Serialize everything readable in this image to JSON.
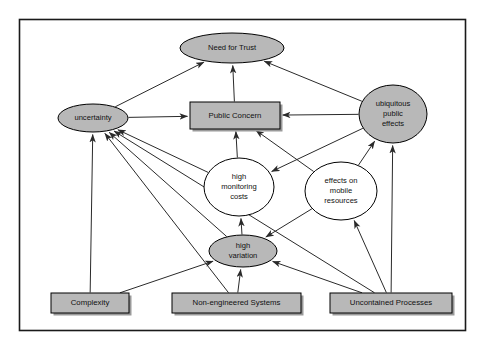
{
  "diagram": {
    "frame": {
      "x": 19,
      "y": 19,
      "width": 446,
      "height": 311
    },
    "nodes": [
      {
        "id": "need-for-trust",
        "label": "Need for Trust",
        "shape": "ellipse",
        "fill": "#b8b8b8",
        "cx": 232,
        "cy": 48,
        "rx": 52,
        "ry": 15,
        "lines": [
          "Need for Trust"
        ]
      },
      {
        "id": "uncertainty",
        "label": "uncertainty",
        "shape": "ellipse",
        "fill": "#b8b8b8",
        "cx": 93,
        "cy": 118,
        "rx": 35,
        "ry": 14,
        "lines": [
          "uncertainty"
        ]
      },
      {
        "id": "public-concern",
        "label": "Public Concern",
        "shape": "rect",
        "fill": "#b8b8b8",
        "x": 190,
        "y": 102,
        "width": 90,
        "height": 27,
        "lines": [
          "Public Concern"
        ]
      },
      {
        "id": "ubiquitous-public-effects",
        "label": "ubiquitous public effects",
        "shape": "ellipse",
        "fill": "#b8b8b8",
        "cx": 393,
        "cy": 114,
        "rx": 34,
        "ry": 29,
        "lines": [
          "ubiquitous",
          "public",
          "effects"
        ]
      },
      {
        "id": "high-monitoring-costs",
        "label": "high monitoring costs",
        "shape": "ellipse",
        "fill": "#ffffff",
        "cx": 239,
        "cy": 187,
        "rx": 35,
        "ry": 29,
        "lines": [
          "high",
          "monitoring",
          "costs"
        ]
      },
      {
        "id": "effects-on-mobile-resources",
        "label": "effects on mobile resources",
        "shape": "ellipse",
        "fill": "#ffffff",
        "cx": 341,
        "cy": 191,
        "rx": 36,
        "ry": 29,
        "lines": [
          "effects on",
          "mobile",
          "resources"
        ]
      },
      {
        "id": "high-variation",
        "label": "high variation",
        "shape": "ellipse",
        "fill": "#b8b8b8",
        "cx": 243,
        "cy": 251,
        "rx": 34,
        "ry": 16,
        "lines": [
          "high",
          "variation"
        ]
      },
      {
        "id": "complexity",
        "label": "Complexity",
        "shape": "rect",
        "fill": "#b8b8b8",
        "x": 51,
        "y": 293,
        "width": 78,
        "height": 20,
        "lines": [
          "Complexity"
        ]
      },
      {
        "id": "non-engineered-systems",
        "label": "Non-engineered Systems",
        "shape": "rect",
        "fill": "#b8b8b8",
        "x": 172,
        "y": 293,
        "width": 129,
        "height": 20,
        "lines": [
          "Non-engineered Systems"
        ]
      },
      {
        "id": "uncontained-processes",
        "label": "Uncontained Processes",
        "shape": "rect",
        "fill": "#b8b8b8",
        "x": 330,
        "y": 293,
        "width": 122,
        "height": 20,
        "lines": [
          "Uncontained Processes"
        ]
      }
    ],
    "edges": [
      {
        "from": "uncertainty",
        "to": "need-for-trust"
      },
      {
        "from": "uncertainty",
        "to": "public-concern"
      },
      {
        "from": "public-concern",
        "to": "need-for-trust"
      },
      {
        "from": "ubiquitous-public-effects",
        "to": "need-for-trust"
      },
      {
        "from": "ubiquitous-public-effects",
        "to": "public-concern"
      },
      {
        "from": "ubiquitous-public-effects",
        "to": "high-monitoring-costs"
      },
      {
        "from": "high-monitoring-costs",
        "to": "public-concern"
      },
      {
        "from": "high-monitoring-costs",
        "to": "uncertainty"
      },
      {
        "from": "effects-on-mobile-resources",
        "to": "public-concern"
      },
      {
        "from": "effects-on-mobile-resources",
        "to": "ubiquitous-public-effects"
      },
      {
        "from": "effects-on-mobile-resources",
        "to": "high-variation"
      },
      {
        "from": "high-variation",
        "to": "high-monitoring-costs"
      },
      {
        "from": "high-variation",
        "to": "uncertainty"
      },
      {
        "from": "complexity",
        "to": "uncertainty"
      },
      {
        "from": "complexity",
        "to": "high-variation"
      },
      {
        "from": "non-engineered-systems",
        "to": "uncertainty"
      },
      {
        "from": "non-engineered-systems",
        "to": "high-variation"
      },
      {
        "from": "uncontained-processes",
        "to": "uncertainty"
      },
      {
        "from": "uncontained-processes",
        "to": "high-variation"
      },
      {
        "from": "uncontained-processes",
        "to": "effects-on-mobile-resources"
      },
      {
        "from": "uncontained-processes",
        "to": "ubiquitous-public-effects"
      }
    ]
  }
}
